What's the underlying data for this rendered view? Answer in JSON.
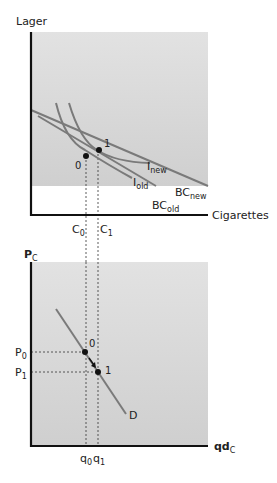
{
  "top_chart": {
    "y_axis_label": "Lager",
    "x_axis_label": "Cigarettes",
    "curves": {
      "i_new": {
        "base": "I",
        "sub": "new"
      },
      "i_old": {
        "base": "I",
        "sub": "old"
      },
      "bc_new": {
        "base": "BC",
        "sub": "new"
      },
      "bc_old": {
        "base": "BC",
        "sub": "old"
      }
    },
    "points": {
      "p0": "0",
      "p1": "1"
    },
    "ticks": {
      "c0": {
        "base": "C",
        "sub": "0"
      },
      "c1": {
        "base": "C",
        "sub": "1"
      }
    }
  },
  "bottom_chart": {
    "y_axis_label": {
      "base": "P",
      "sub": "C"
    },
    "x_axis_label": {
      "base": "qd",
      "sub": "C"
    },
    "curve_label": "D",
    "points": {
      "p0": "0",
      "p1": "1"
    },
    "ticks_y": {
      "p0": {
        "base": "P",
        "sub": "0"
      },
      "p1": {
        "base": "P",
        "sub": "1"
      }
    },
    "ticks_x": {
      "q0": {
        "base": "q",
        "sub": "0"
      },
      "q1": {
        "base": "q",
        "sub": "1"
      }
    }
  },
  "colors": {
    "panel_bg": "#d6d6d6",
    "curve": "#7a7a7a",
    "axis": "#111111"
  }
}
